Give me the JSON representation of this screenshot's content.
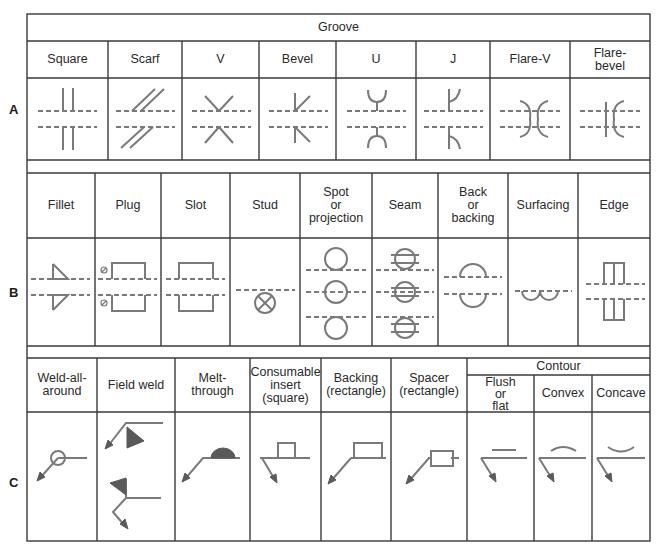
{
  "sections": {
    "A": {
      "letter": "A",
      "header": "Groove",
      "columns": [
        "Square",
        "Scarf",
        "V",
        "Bevel",
        "U",
        "J",
        "Flare-V",
        "Flare-\nbevel"
      ]
    },
    "B": {
      "letter": "B",
      "columns": [
        "Fillet",
        "Plug",
        "Slot",
        "Stud",
        "Spot\nor\nprojection",
        "Seam",
        "Back\nor\nbacking",
        "Surfacing",
        "Edge"
      ]
    },
    "C": {
      "letter": "C",
      "columns": [
        "Weld-all-\naround",
        "Field weld",
        "Melt-\nthrough",
        "Consumable\ninsert\n(square)",
        "Backing\n(rectangle)",
        "Spacer\n(rectangle)"
      ],
      "contour_header": "Contour",
      "contour_columns": [
        "Flush\nor\nflat",
        "Convex",
        "Concave"
      ]
    }
  },
  "colors": {
    "grid": "#3a3a3a",
    "symbol": "#7a7a7a",
    "symbol_fill": "#5a5a5a",
    "background": "#ffffff"
  }
}
